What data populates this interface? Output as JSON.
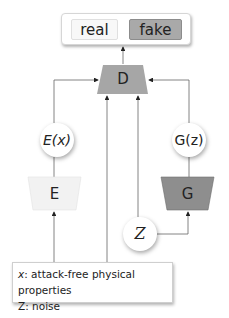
{
  "output": {
    "real_label": "real",
    "fake_label": "fake"
  },
  "nodes": {
    "discriminator": "D",
    "encoder": "E",
    "generator": "G",
    "encoder_output": "E(x)",
    "generator_output": "G(z)",
    "noise": "Z"
  },
  "legend": {
    "items": [
      {
        "symbol": "x",
        "text": ": attack-free physical properties"
      },
      {
        "symbol": "Z",
        "text": ": noise"
      }
    ]
  },
  "colors": {
    "discriminator_fill": "#a6a6a6",
    "generator_fill": "#8e8e8e",
    "encoder_fill": "#f2f2f2",
    "fake_fill": "#a9a9a9",
    "real_fill": "#f8f8f8",
    "line": "#555555"
  }
}
